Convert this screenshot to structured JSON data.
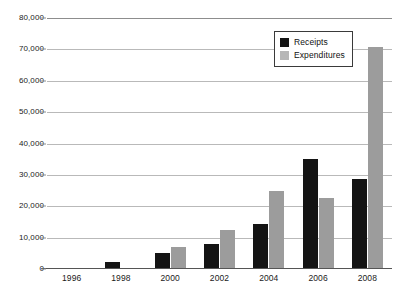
{
  "chart_data": {
    "type": "bar",
    "title": "",
    "subtitle": "",
    "xlabel": "",
    "ylabel": "",
    "categories": [
      "1996",
      "1998",
      "2000",
      "2002",
      "2004",
      "2006",
      "2008"
    ],
    "series": [
      {
        "name": "Receipts",
        "color": "#141414",
        "values": [
          300,
          2300,
          5000,
          8000,
          14500,
          35000,
          28800
        ]
      },
      {
        "name": "Expenditures",
        "color": "#9c9c9c",
        "values": [
          200,
          300,
          7000,
          12500,
          25000,
          22500,
          70800
        ]
      }
    ],
    "ylim": [
      0,
      80000
    ],
    "ytick_values": [
      0,
      10000,
      20000,
      30000,
      40000,
      50000,
      60000,
      70000,
      80000
    ],
    "ytick_labels": [
      "0",
      "10,000",
      "20,000",
      "30,000",
      "40,000",
      "50,000",
      "60,000",
      "70,000",
      "80,000"
    ],
    "grid": true,
    "grid_axis": "y",
    "legend_position": "upper-right",
    "legend_entries": [
      {
        "label": "Receipts",
        "swatch": "#141414"
      },
      {
        "label": "Expenditures",
        "swatch": "#b6b6b6"
      }
    ]
  }
}
